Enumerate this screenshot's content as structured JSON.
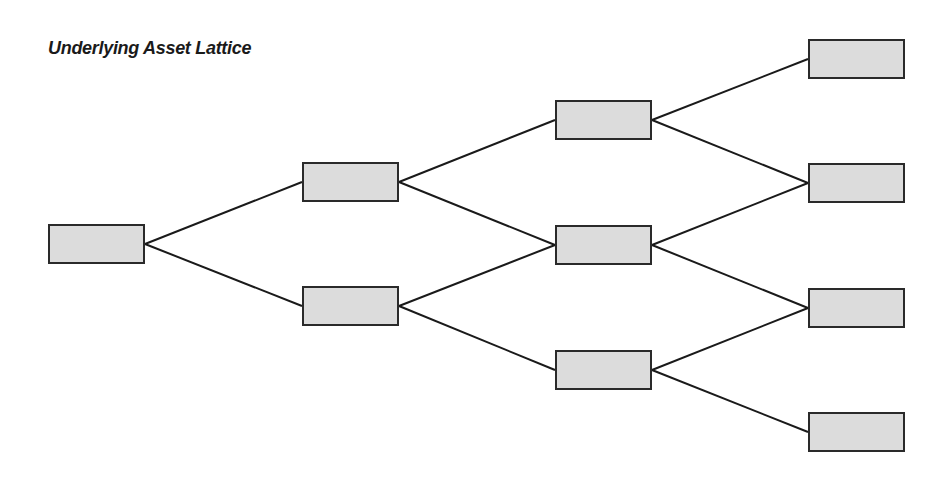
{
  "title": "Underlying Asset Lattice",
  "colors": {
    "node_fill": "#dcdcdc",
    "node_border": "#2a2a2a",
    "edge": "#1a1a1a"
  },
  "nodes": [
    {
      "id": "n0_0",
      "x": 48,
      "y": 224
    },
    {
      "id": "n1_0",
      "x": 302,
      "y": 162
    },
    {
      "id": "n1_1",
      "x": 302,
      "y": 286
    },
    {
      "id": "n2_0",
      "x": 555,
      "y": 100
    },
    {
      "id": "n2_1",
      "x": 555,
      "y": 225
    },
    {
      "id": "n2_2",
      "x": 555,
      "y": 350
    },
    {
      "id": "n3_0",
      "x": 808,
      "y": 39
    },
    {
      "id": "n3_1",
      "x": 808,
      "y": 163
    },
    {
      "id": "n3_2",
      "x": 808,
      "y": 288
    },
    {
      "id": "n3_3",
      "x": 808,
      "y": 412
    }
  ],
  "edges": [
    [
      "n0_0",
      "n1_0"
    ],
    [
      "n0_0",
      "n1_1"
    ],
    [
      "n1_0",
      "n2_0"
    ],
    [
      "n1_0",
      "n2_1"
    ],
    [
      "n1_1",
      "n2_1"
    ],
    [
      "n1_1",
      "n2_2"
    ],
    [
      "n2_0",
      "n3_0"
    ],
    [
      "n2_0",
      "n3_1"
    ],
    [
      "n2_1",
      "n3_1"
    ],
    [
      "n2_1",
      "n3_2"
    ],
    [
      "n2_2",
      "n3_2"
    ],
    [
      "n2_2",
      "n3_3"
    ]
  ]
}
